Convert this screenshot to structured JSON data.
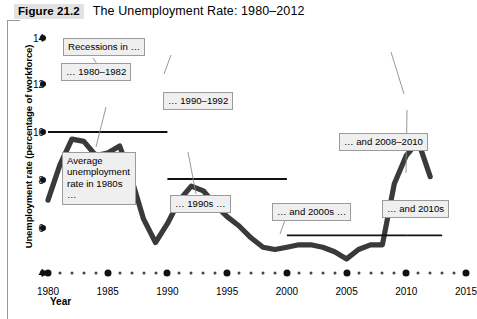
{
  "figure": {
    "number_label": "Figure 21.2",
    "title": "The Unemployment Rate: 1980–2012"
  },
  "axes": {
    "y_title": "Unemployment rate (percentage of workforce)",
    "x_title": "Year",
    "y_ticks": [
      "14",
      "12",
      "10",
      "8",
      "6",
      "4"
    ],
    "x_ticks": [
      "1980",
      "1985",
      "1990",
      "1995",
      "2000",
      "2005",
      "2010",
      "2015"
    ]
  },
  "callouts": {
    "recessions": "Recessions in …",
    "r1980": "… 1980–1982",
    "r1990": "… 1990–1992",
    "r2008": "… and 2008–2010",
    "avg_1980s": "Average unemployment rate in 1980s …",
    "avg_1990s": "… 1990s …",
    "avg_2000s": "… and 2000s …",
    "avg_2010s": "… and 2010s"
  },
  "colors": {
    "series": "#3a3a3a",
    "average_line": "#111111",
    "callout_fill": "#efefef",
    "callout_border": "#9b9b9b",
    "fignum_chip": "#e2e2e2"
  },
  "chart_data": {
    "type": "line",
    "title": "The Unemployment Rate: 1980–2012",
    "xlabel": "Year",
    "ylabel": "Unemployment rate (percentage of workforce)",
    "xlim": [
      1980,
      2015
    ],
    "ylim": [
      4,
      14
    ],
    "grid": false,
    "legend": "none",
    "x": [
      1980,
      1981,
      1982,
      1983,
      1984,
      1985,
      1986,
      1987,
      1988,
      1989,
      1990,
      1991,
      1992,
      1993,
      1994,
      1995,
      1996,
      1997,
      1998,
      1999,
      2000,
      2001,
      2002,
      2003,
      2004,
      2005,
      2006,
      2007,
      2008,
      2009,
      2010,
      2011,
      2012
    ],
    "series": [
      {
        "name": "Unemployment rate",
        "values": [
          7.1,
          8.6,
          9.7,
          9.6,
          9.0,
          9.1,
          9.4,
          8.0,
          6.3,
          5.3,
          6.1,
          7.1,
          7.7,
          7.5,
          6.9,
          6.4,
          6.0,
          5.5,
          5.1,
          5.0,
          5.1,
          5.2,
          5.2,
          5.1,
          4.9,
          4.6,
          5.0,
          5.2,
          5.2,
          7.8,
          9.0,
          9.6,
          8.1
        ]
      }
    ],
    "annotations": [
      {
        "text": "Recessions in …",
        "kind": "label"
      },
      {
        "text": "… 1980–1982",
        "kind": "recession-period",
        "x_range": [
          1980,
          1982
        ]
      },
      {
        "text": "… 1990–1992",
        "kind": "recession-period",
        "x_range": [
          1990,
          1992
        ]
      },
      {
        "text": "… and 2008–2010",
        "kind": "recession-period",
        "x_range": [
          2008,
          2010
        ]
      },
      {
        "text": "Average unemployment rate in 1980s …",
        "kind": "average-line",
        "value": 10.0,
        "x_range": [
          1980,
          1990
        ]
      },
      {
        "text": "… 1990s …",
        "kind": "average-line",
        "value": 8.0,
        "x_range": [
          1990,
          2000
        ]
      },
      {
        "text": "… and 2000s …",
        "kind": "average-line",
        "value": 5.6,
        "x_range": [
          2000,
          2010
        ]
      },
      {
        "text": "… and 2010s",
        "kind": "average-line",
        "value": 5.6,
        "x_range": [
          2010,
          2013
        ]
      }
    ],
    "average_lines": [
      {
        "decade": "1980s",
        "value": 10.0,
        "x_range": [
          1980,
          1990
        ]
      },
      {
        "decade": "1990s",
        "value": 8.0,
        "x_range": [
          1990,
          2000
        ]
      },
      {
        "decade": "2000s",
        "value": 5.6,
        "x_range": [
          2000,
          2010
        ]
      },
      {
        "decade": "2010s",
        "value": 5.6,
        "x_range": [
          2010,
          2013
        ]
      }
    ]
  }
}
